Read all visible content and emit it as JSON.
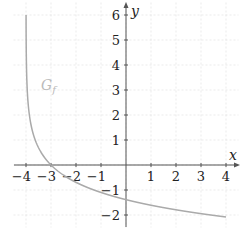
{
  "chart_data": {
    "type": "line",
    "title": "",
    "xlabel": "x",
    "ylabel": "y",
    "xlim": [
      -4.5,
      4.5
    ],
    "ylim": [
      -2.5,
      6.5
    ],
    "grid": true,
    "x_ticks": [
      -4,
      -3,
      -2,
      -1,
      1,
      2,
      3,
      4
    ],
    "y_ticks": [
      -2,
      -1,
      1,
      2,
      3,
      4,
      5,
      6
    ],
    "x_tick_labels": [
      "−4",
      "−3",
      "−2",
      "−1",
      "1",
      "2",
      "3",
      "4"
    ],
    "y_tick_labels": [
      "−2",
      "−1",
      "1",
      "2",
      "3",
      "4",
      "5",
      "6"
    ],
    "annotations": [
      {
        "text": "G_f",
        "x": -3.3,
        "y": 3
      }
    ],
    "series": [
      {
        "name": "G_f",
        "color": "#aaaaaa",
        "x": [
          -3.9975,
          -3.99,
          -3.95,
          -3.9,
          -3.8,
          -3.6,
          -3.4,
          -3.2,
          -3,
          -2.5,
          -2,
          -1,
          0,
          1,
          2,
          3,
          4
        ],
        "values": [
          6,
          4.61,
          3.0,
          2.3,
          1.61,
          0.92,
          0.51,
          0.22,
          0,
          -0.41,
          -0.69,
          -1.1,
          -1.39,
          -1.61,
          -1.79,
          -1.95,
          -2.08
        ]
      }
    ]
  },
  "labels": {
    "x_axis": "x",
    "y_axis": "y",
    "curve": "G",
    "curve_sub": "f"
  }
}
